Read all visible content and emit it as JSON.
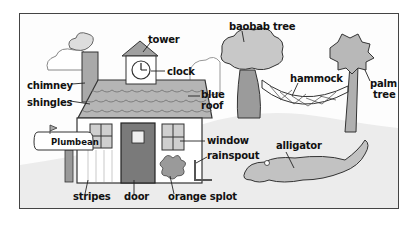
{
  "diagram": {
    "title": "",
    "style": "hand-drawn pencil illustration",
    "labels": {
      "tower": "tower",
      "clock": "clock",
      "chimney": "chimney",
      "shingles": "shingles",
      "blue_roof_1": "blue",
      "blue_roof_2": "roof",
      "baobab_tree": "baobab tree",
      "hammock": "hammock",
      "palm_tree_1": "palm",
      "palm_tree_2": "tree",
      "window": "window",
      "rainspout": "rainspout",
      "alligator": "alligator",
      "stripes": "stripes",
      "door": "door",
      "orange_splot": "orange splot"
    },
    "mailbox_name": "Plumbean",
    "colors": {
      "ink": "#222222",
      "shade": "#bdbdbd",
      "dark_shade": "#8a8a8a",
      "ground": "#e6e6e6"
    }
  }
}
